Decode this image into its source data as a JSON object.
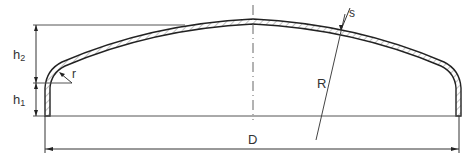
{
  "diagram": {
    "labels": {
      "h2": "h",
      "h2_sub": "2",
      "h1": "h",
      "h1_sub": "1",
      "r": "r",
      "s": "s",
      "R": "R",
      "D": "D"
    },
    "colors": {
      "line": "#333333",
      "hatch": "#777777",
      "background": "#ffffff"
    }
  }
}
